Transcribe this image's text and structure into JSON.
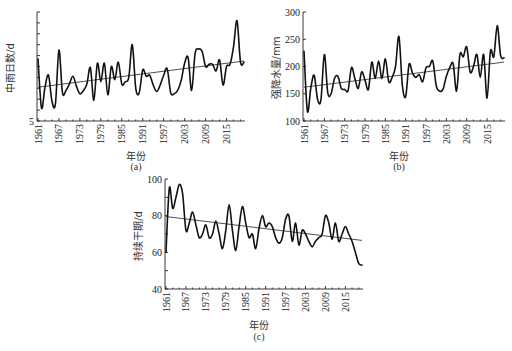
{
  "chart_data": [
    {
      "id": "a",
      "type": "line",
      "caption": "(a)",
      "xlabel": "年份",
      "ylabel": "中雨日数/d",
      "ytick_labels": [
        "5"
      ],
      "ylim": [
        5,
        15
      ],
      "xtick_labels": [
        "1961",
        "1967",
        "1973",
        "1979",
        "1985",
        "1991",
        "1997",
        "2003",
        "2009",
        "2015"
      ],
      "x": [
        1961,
        1962,
        1963,
        1964,
        1965,
        1966,
        1967,
        1968,
        1969,
        1970,
        1971,
        1972,
        1973,
        1974,
        1975,
        1976,
        1977,
        1978,
        1979,
        1980,
        1981,
        1982,
        1983,
        1984,
        1985,
        1986,
        1987,
        1988,
        1989,
        1990,
        1991,
        1992,
        1993,
        1994,
        1995,
        1996,
        1997,
        1998,
        1999,
        2000,
        2001,
        2002,
        2003,
        2004,
        2005,
        2006,
        2007,
        2008,
        2009,
        2010,
        2011,
        2012,
        2013,
        2014,
        2015,
        2016,
        2017,
        2018,
        2019,
        2020
      ],
      "values": [
        10.7,
        6.2,
        8.1,
        9.2,
        6.8,
        6.6,
        11.5,
        7.6,
        7.8,
        8.4,
        9.1,
        8.2,
        7.5,
        7.8,
        8.4,
        9.9,
        6.9,
        10.3,
        8.6,
        10.3,
        7.4,
        10.0,
        8.8,
        10.4,
        8.4,
        8.6,
        9.0,
        12.0,
        8.0,
        7.6,
        9.7,
        9.1,
        9.2,
        8.3,
        7.7,
        8.3,
        9.2,
        9.8,
        7.6,
        7.5,
        7.8,
        8.7,
        10.3,
        10.8,
        7.8,
        11.2,
        11.6,
        11.4,
        10.0,
        10.2,
        10.2,
        9.6,
        10.6,
        8.3,
        10.0,
        10.2,
        11.8,
        14.2,
        10.4,
        10.4
      ],
      "trend": {
        "start": 8.1,
        "end": 10.5
      },
      "grid": false,
      "legend": "none"
    },
    {
      "id": "b",
      "type": "line",
      "caption": "(b)",
      "xlabel": "年份",
      "ylabel": "强降水量/mm",
      "ytick_labels": [
        "100",
        "150",
        "200",
        "250",
        "300"
      ],
      "ylim": [
        100,
        300
      ],
      "xtick_labels": [
        "1961",
        "1967",
        "1973",
        "1979",
        "1985",
        "1991",
        "1997",
        "2003",
        "2009",
        "2015"
      ],
      "x": [
        1961,
        1962,
        1963,
        1964,
        1965,
        1966,
        1967,
        1968,
        1969,
        1970,
        1971,
        1972,
        1973,
        1974,
        1975,
        1976,
        1977,
        1978,
        1979,
        1980,
        1981,
        1982,
        1983,
        1984,
        1985,
        1986,
        1987,
        1988,
        1989,
        1990,
        1991,
        1992,
        1993,
        1994,
        1995,
        1996,
        1997,
        1998,
        1999,
        2000,
        2001,
        2002,
        2003,
        2004,
        2005,
        2006,
        2007,
        2008,
        2009,
        2010,
        2011,
        2012,
        2013,
        2014,
        2015,
        2016,
        2017,
        2018,
        2019,
        2020
      ],
      "values": [
        228,
        118,
        160,
        184,
        140,
        139,
        222,
        152,
        150,
        178,
        182,
        160,
        158,
        156,
        198,
        178,
        160,
        190,
        175,
        158,
        208,
        178,
        210,
        178,
        214,
        172,
        180,
        200,
        255,
        166,
        145,
        204,
        188,
        180,
        185,
        172,
        198,
        200,
        210,
        165,
        155,
        158,
        182,
        198,
        205,
        155,
        222,
        218,
        236,
        190,
        200,
        222,
        180,
        222,
        142,
        228,
        218,
        275,
        220,
        216
      ],
      "trend": {
        "start": 162,
        "end": 208
      },
      "grid": false,
      "legend": "none"
    },
    {
      "id": "c",
      "type": "line",
      "caption": "(c)",
      "xlabel": "年份",
      "ylabel": "持续干期/d",
      "ytick_labels": [
        "40",
        "60",
        "80",
        "100"
      ],
      "ylim": [
        40,
        100
      ],
      "xtick_labels": [
        "1961",
        "1967",
        "1973",
        "1979",
        "1985",
        "1991",
        "1997",
        "2003",
        "2009",
        "2015"
      ],
      "x": [
        1961,
        1962,
        1963,
        1964,
        1965,
        1966,
        1967,
        1968,
        1969,
        1970,
        1971,
        1972,
        1973,
        1974,
        1975,
        1976,
        1977,
        1978,
        1979,
        1980,
        1981,
        1982,
        1983,
        1984,
        1985,
        1986,
        1987,
        1988,
        1989,
        1990,
        1991,
        1992,
        1993,
        1994,
        1995,
        1996,
        1997,
        1998,
        1999,
        2000,
        2001,
        2002,
        2003,
        2004,
        2005,
        2006,
        2007,
        2008,
        2009,
        2010,
        2011,
        2012,
        2013,
        2014,
        2015,
        2016,
        2017,
        2018,
        2019,
        2020
      ],
      "values": [
        60,
        95,
        84,
        90,
        97,
        92,
        72,
        76,
        82,
        75,
        68,
        70,
        75,
        68,
        70,
        77,
        70,
        62,
        72,
        86,
        72,
        61,
        74,
        85,
        76,
        68,
        70,
        62,
        73,
        80,
        74,
        76,
        74,
        68,
        65,
        68,
        78,
        80,
        66,
        76,
        64,
        72,
        70,
        66,
        63,
        66,
        68,
        70,
        80,
        76,
        67,
        76,
        66,
        70,
        74,
        70,
        66,
        60,
        54,
        53
      ],
      "trend": {
        "start": 79.5,
        "end": 66.5
      },
      "grid": false,
      "legend": "none"
    }
  ]
}
